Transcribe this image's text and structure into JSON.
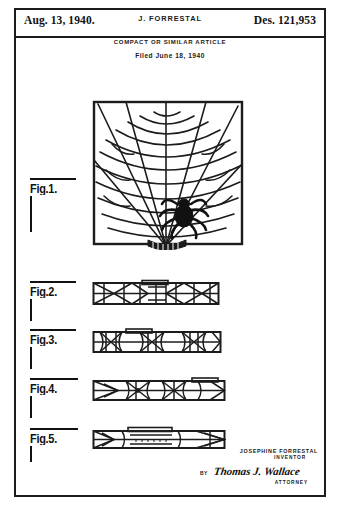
{
  "document": {
    "type": "design-patent-drawing",
    "date": "Aug. 13, 1940.",
    "inventor_header": "J. FORRESTAL",
    "patent_number": "Des. 121,953",
    "title": "COMPACT OR SIMILAR ARTICLE",
    "filed": "Filed June 18, 1940"
  },
  "figures": [
    {
      "id": "fig1",
      "label": "Fig.1.",
      "caption": "spider-web compact front view"
    },
    {
      "id": "fig2",
      "label": "Fig.2.",
      "caption": "compact side elevation web pattern"
    },
    {
      "id": "fig3",
      "label": "Fig.3.",
      "caption": "compact side elevation opposite"
    },
    {
      "id": "fig4",
      "label": "Fig.4.",
      "caption": "compact bottom elevation"
    },
    {
      "id": "fig5",
      "label": "Fig.5.",
      "caption": "compact end elevation with clasp"
    }
  ],
  "signature": {
    "inventor_name": "JOSEPHINE FORRESTAL",
    "inventor_role": "INVENTOR",
    "by_label": "BY",
    "attorney_name": "Thomas J. Wallace",
    "attorney_role": "ATTORNEY"
  },
  "colors": {
    "ink": "#1c1c1c",
    "paper": "#ffffff"
  }
}
